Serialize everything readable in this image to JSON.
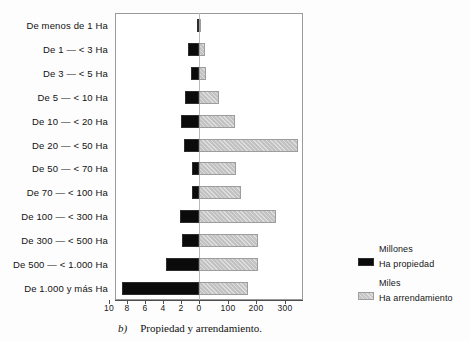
{
  "figure": {
    "caption_letter": "b)",
    "caption_text": "Propiedad y arrendamiento."
  },
  "legend": {
    "series": [
      {
        "title": "Millones",
        "label": "Ha propiedad",
        "swatch": "black-swatch-icon",
        "color": "#0b0b0b"
      },
      {
        "title": "Miles",
        "label": "Ha arrendamiento",
        "swatch": "grey-hatch-swatch-icon",
        "color": "#c2c2c2"
      }
    ]
  },
  "axis": {
    "left_ticks": [
      "10",
      "8",
      "6",
      "4",
      "2"
    ],
    "center_tick": "0",
    "right_ticks": [
      "100",
      "200",
      "300"
    ],
    "tick_positions_px": [
      109,
      127,
      145,
      163,
      181,
      199,
      228,
      256,
      285
    ]
  },
  "chart_data": {
    "type": "bar",
    "orientation": "horizontal",
    "subtype": "bidirectional-pyramid",
    "title": "",
    "subtitle": "",
    "xlabel": "",
    "ylabel": "",
    "grid": false,
    "legend_position": "right-outside",
    "categories": [
      "De menos de 1 Ha",
      "De 1 — < 3 Ha",
      "De 3 — < 5 Ha",
      "De 5 — < 10 Ha",
      "De 10 — < 20 Ha",
      "De 20 — < 50 Ha",
      "De 50 — < 70 Ha",
      "De 70 — < 100 Ha",
      "De 100 — < 300 Ha",
      "De 300 — < 500 Ha",
      "De 500 — < 1.000 Ha",
      "De 1.000 y más Ha"
    ],
    "series": [
      {
        "name": "Ha propiedad",
        "unit": "Millones",
        "side": "left",
        "color": "#0b0b0b",
        "axis_max": 10,
        "axis_ticks": [
          0,
          2,
          4,
          6,
          8,
          10
        ],
        "values": [
          0.2,
          1.2,
          0.85,
          1.6,
          2.0,
          1.7,
          0.8,
          0.75,
          2.1,
          1.9,
          3.7,
          8.6
        ]
      },
      {
        "name": "Ha arrendamiento",
        "unit": "Miles",
        "side": "right",
        "color": "#c2c2c2",
        "axis_max": 365,
        "axis_ticks": [
          0,
          100,
          200,
          300
        ],
        "values": [
          8,
          20,
          25,
          70,
          125,
          345,
          130,
          145,
          270,
          205,
          205,
          170
        ]
      }
    ]
  }
}
